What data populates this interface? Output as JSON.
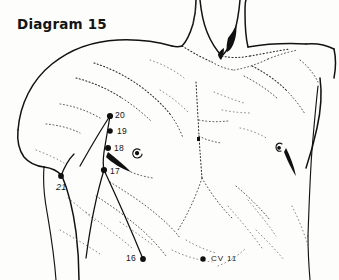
{
  "figure": {
    "title": "Diagram 15",
    "background_color": "#fdfdfc",
    "ink_color": "#121212"
  },
  "points": [
    {
      "id": "p20",
      "label": "20",
      "x": 110,
      "y": 116,
      "label_x": 115,
      "label_y": 111
    },
    {
      "id": "p19",
      "label": "19",
      "x": 110,
      "y": 131,
      "label_x": 116,
      "label_y": 127
    },
    {
      "id": "p18",
      "label": "18",
      "x": 108,
      "y": 148,
      "label_x": 114,
      "label_y": 144
    },
    {
      "id": "p17",
      "label": "17",
      "x": 104,
      "y": 170,
      "label_x": 110,
      "label_y": 167
    },
    {
      "id": "p21",
      "label": "21",
      "x": 61,
      "y": 176,
      "label_x": 60,
      "label_y": 183
    },
    {
      "id": "p16",
      "label": "16",
      "x": 143,
      "y": 259,
      "label_x": 128,
      "label_y": 255
    },
    {
      "id": "cv11",
      "label": "CV 11",
      "x": 203,
      "y": 259,
      "label_x": 210,
      "label_y": 255
    }
  ],
  "labels": {
    "title": "Diagram 15",
    "p20": "20",
    "p19": "19",
    "p18": "18",
    "p17": "17",
    "p21": "21",
    "p16": "16",
    "cv11": "CV 11"
  }
}
